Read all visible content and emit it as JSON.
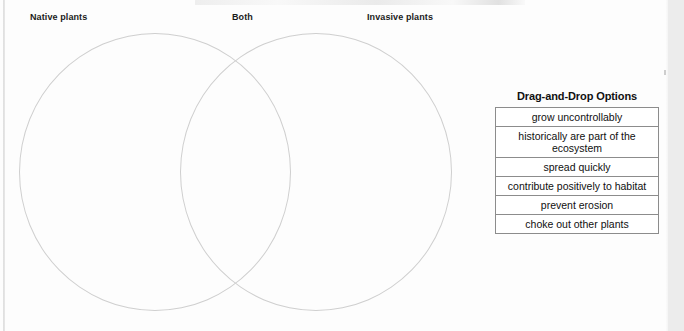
{
  "diagram": {
    "type": "venn-two-set",
    "labels": {
      "left": "Native plants",
      "overlap": "Both",
      "right": "Invasive plants"
    },
    "circle_stroke_color": "#cfcfcf"
  },
  "options_panel": {
    "title": "Drag-and-Drop Options",
    "items": [
      {
        "label": "grow uncontrollably"
      },
      {
        "label": "historically are part of the ecosystem"
      },
      {
        "label": "spread quickly"
      },
      {
        "label": "contribute positively to habitat"
      },
      {
        "label": "prevent erosion"
      },
      {
        "label": "choke out other plants"
      }
    ],
    "border_color": "#8c8c8c"
  },
  "page": {
    "background_color": "#fdfdfd",
    "gutter_color": "#ececec"
  }
}
